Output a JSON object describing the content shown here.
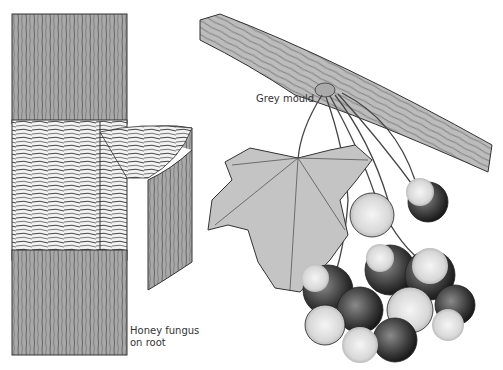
{
  "illustration": {
    "panels": [
      {
        "name": "honey-fungus-root",
        "description": "Root section with bark peeled back showing fungal strands"
      },
      {
        "name": "grey-mould-grapes",
        "description": "Branch with leaf and cluster of berries covered with grey mould"
      }
    ],
    "labels": {
      "grey_mould": "Grey mould",
      "honey_fungus_line1": "Honey fungus",
      "honey_fungus_line2": "on root"
    },
    "colors": {
      "ink": "#2a2a2a",
      "bark": "#9a9a9a",
      "leaf": "#bdbdbd",
      "background": "#ffffff"
    }
  }
}
